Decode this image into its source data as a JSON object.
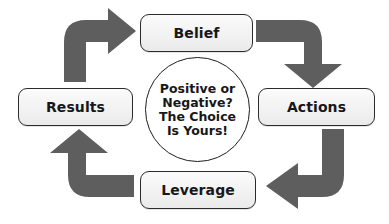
{
  "diagram": {
    "colors": {
      "arrow": "#5e5e5e",
      "node_border": "#2b2b2b",
      "node_fill": "#f2f2f2",
      "text": "#17171a",
      "background": "#ffffff"
    },
    "center": {
      "lines": [
        "Positive or",
        "Negative?",
        "The Choice",
        "Is Yours!"
      ]
    },
    "nodes": [
      {
        "id": "belief",
        "label": "Belief",
        "position": "top"
      },
      {
        "id": "actions",
        "label": "Actions",
        "position": "right"
      },
      {
        "id": "leverage",
        "label": "Leverage",
        "position": "bottom"
      },
      {
        "id": "results",
        "label": "Results",
        "position": "left"
      }
    ],
    "arrows": [
      {
        "id": "results-to-belief",
        "from": "Results",
        "to": "Belief",
        "direction": "right"
      },
      {
        "id": "belief-to-actions",
        "from": "Belief",
        "to": "Actions",
        "direction": "down"
      },
      {
        "id": "actions-to-leverage",
        "from": "Actions",
        "to": "Leverage",
        "direction": "left"
      },
      {
        "id": "leverage-to-results",
        "from": "Leverage",
        "to": "Results",
        "direction": "up"
      }
    ]
  }
}
